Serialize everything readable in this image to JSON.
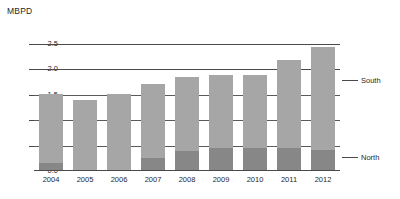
{
  "chart_data": {
    "type": "bar",
    "stacked": true,
    "title": "",
    "ylabel": "MBPD",
    "xlabel": "",
    "ylim": [
      0.0,
      2.75
    ],
    "yticks": [
      "0.0",
      "0.5",
      "1.0",
      "1.5",
      "2.0",
      "2.5"
    ],
    "ytick_values": [
      0.0,
      0.5,
      1.0,
      1.5,
      2.0,
      2.5
    ],
    "grid": true,
    "legend_position": "right",
    "categories": [
      "2004",
      "2005",
      "2006",
      "2007",
      "2008",
      "2009",
      "2010",
      "2011",
      "2012"
    ],
    "series": [
      {
        "name": "North",
        "color": "#878787",
        "values": [
          0.15,
          0.0,
          0.0,
          0.25,
          0.4,
          0.45,
          0.45,
          0.45,
          0.42
        ]
      },
      {
        "name": "South",
        "color": "#a6a6a6",
        "values": [
          1.37,
          1.4,
          1.52,
          1.45,
          1.45,
          1.43,
          1.43,
          1.73,
          2.01
        ]
      }
    ],
    "totals": [
      1.52,
      1.4,
      1.52,
      1.7,
      1.85,
      1.88,
      1.88,
      2.18,
      2.43
    ]
  },
  "legend": [
    {
      "label": "South",
      "color": "#a6a6a6"
    },
    {
      "label": "North",
      "color": "#878787"
    }
  ]
}
